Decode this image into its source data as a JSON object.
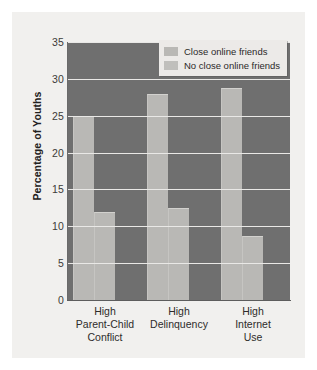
{
  "chart_data": {
    "type": "bar",
    "title": "",
    "xlabel": "",
    "ylabel": "Percentage of Youths",
    "ylim": [
      0,
      35
    ],
    "ytick_values": [
      35,
      30,
      25,
      20,
      15,
      10,
      5,
      0
    ],
    "ytick_labels": [
      "35",
      "30",
      "25",
      "20",
      "15",
      "10",
      "5",
      "0"
    ],
    "grid": true,
    "legend_position": "top-right",
    "categories": [
      "High\nParent-Child\nConflict",
      "High\nDelinquency",
      "High\nInternet\nUse"
    ],
    "category_lines": [
      [
        "High",
        "Parent-Child",
        "Conflict"
      ],
      [
        "High",
        "Delinquency"
      ],
      [
        "High",
        "Internet",
        "Use"
      ]
    ],
    "series": [
      {
        "name": "Close online friends",
        "values": [
          25.0,
          28.0,
          28.8
        ]
      },
      {
        "name": "No close online friends",
        "values": [
          12.0,
          12.5,
          8.7
        ]
      }
    ]
  },
  "legend": {
    "items": [
      {
        "label": "Close online friends",
        "color": "#b9b8b5"
      },
      {
        "label": "No close online friends",
        "color": "#c0bfbc"
      }
    ]
  },
  "colors": {
    "figure_background": "#f1f0ee",
    "plot_background": "#6f6f6f",
    "bar_fill": "#b9b8b5",
    "gridline": "#e9e8e6",
    "axis_text": "#2e2c2b"
  }
}
